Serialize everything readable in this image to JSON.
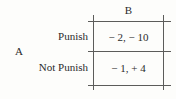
{
  "figure": {
    "row_player": "A",
    "column_player_header": "B",
    "rows": [
      {
        "label": "Punish",
        "payoff": "− 2, − 10"
      },
      {
        "label": "Not Punish",
        "payoff": "− 1, + 4"
      }
    ],
    "colors": {
      "background": "#fdfdfb",
      "rule": "#5c5c5a",
      "text": "#2b2b2b"
    }
  }
}
